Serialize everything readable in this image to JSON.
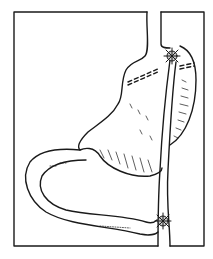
{
  "figure": {
    "type": "anatomical-line-drawing",
    "colors": {
      "line": "#1a1a1a",
      "background": "#ffffff"
    }
  }
}
